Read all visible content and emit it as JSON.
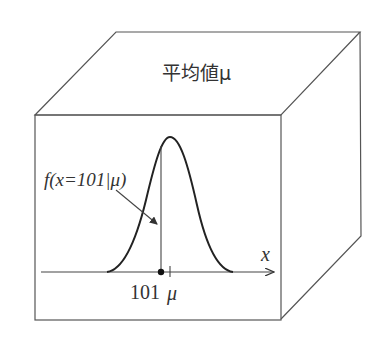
{
  "diagram": {
    "type": "3d-box-with-normal-distribution",
    "top_face_label": "平均値μ",
    "front_face": {
      "curve": "normal-distribution",
      "annotation": "f(x=101|μ)",
      "x_axis_label": "x",
      "tick_labels": {
        "point": "101",
        "mean": "μ"
      }
    }
  },
  "colors": {
    "line": "#555555",
    "curve": "#222222",
    "text": "#333333",
    "background": "#ffffff"
  }
}
